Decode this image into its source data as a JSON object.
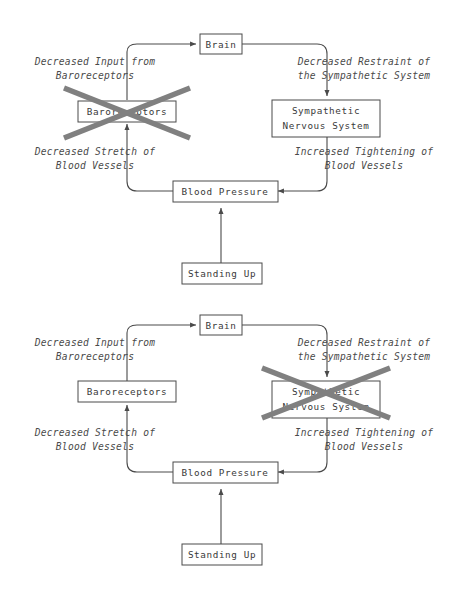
{
  "figure": {
    "kind": "flow-diagram",
    "background_color": "#ffffff",
    "line_color": "#4a4a4a",
    "text_color": "#3a3a3a",
    "x_mark_color": "#808080",
    "panel_count": 2
  },
  "panels": [
    {
      "id": "panel-top",
      "crossed_out_node": "baroreceptors",
      "nodes": {
        "brain": "Brain",
        "baroreceptors": "Baroreceptors",
        "sympathetic_line1": "Sympathetic",
        "sympathetic_line2": "Nervous System",
        "blood_pressure": "Blood Pressure",
        "standing_up": "Standing Up"
      },
      "edge_labels": {
        "top_left_line1": "Decreased Input from",
        "top_left_line2": "Baroreceptors",
        "top_right_line1": "Decreased Restraint of",
        "top_right_line2": "the Sympathetic System",
        "bottom_left_line1": "Decreased Stretch of",
        "bottom_left_line2": "Blood Vessels",
        "bottom_right_line1": "Increased Tightening of",
        "bottom_right_line2": "Blood Vessels"
      }
    },
    {
      "id": "panel-bottom",
      "crossed_out_node": "sympathetic-nervous-system",
      "nodes": {
        "brain": "Brain",
        "baroreceptors": "Baroreceptors",
        "sympathetic_line1": "Sympathetic",
        "sympathetic_line2": "Nervous System",
        "blood_pressure": "Blood Pressure",
        "standing_up": "Standing Up"
      },
      "edge_labels": {
        "top_left_line1": "Decreased Input from",
        "top_left_line2": "Baroreceptors",
        "top_right_line1": "Decreased Restraint of",
        "top_right_line2": "the Sympathetic System",
        "bottom_left_line1": "Decreased Stretch of",
        "bottom_left_line2": "Blood Vessels",
        "bottom_right_line1": "Increased Tightening of",
        "bottom_right_line2": "Blood Vessels"
      }
    }
  ]
}
